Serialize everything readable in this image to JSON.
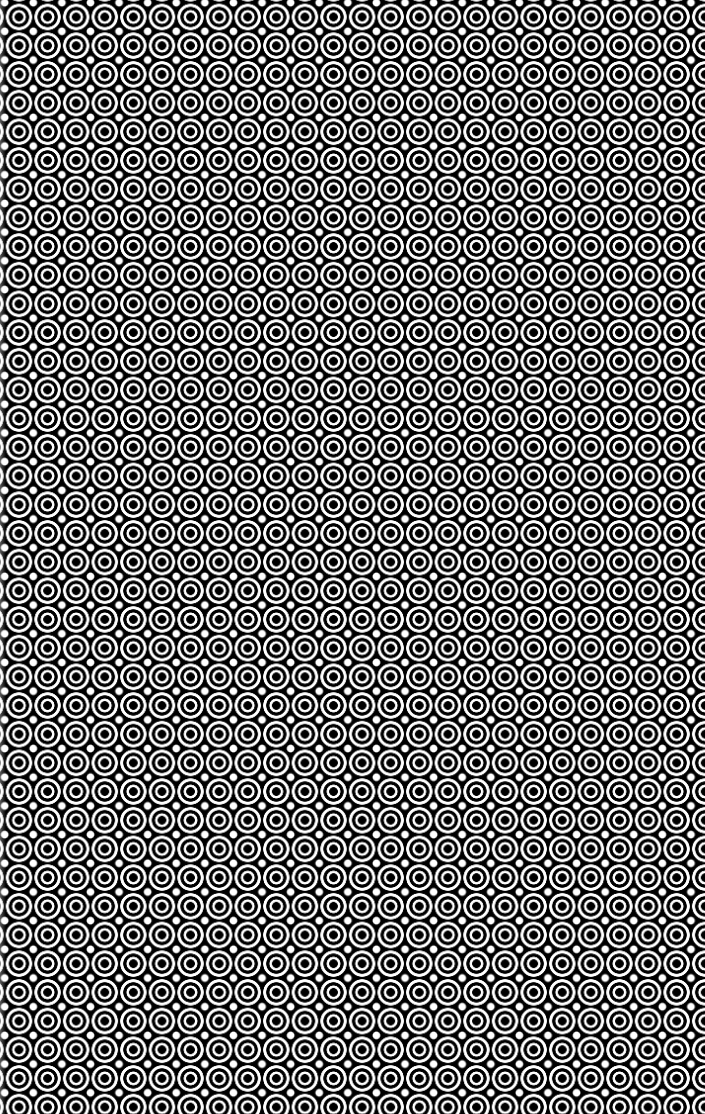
{
  "image": {
    "description": "Repeating pattern of black-and-white concentric circles (target/bullseye tiles) with white diamond shapes in the gaps",
    "colors": {
      "foreground": "#ffffff",
      "background": "#000000"
    },
    "tile": {
      "period_x_px": 28.6,
      "period_y_px": 28.7,
      "columns_visible": 24.7,
      "rows_visible": 38.8
    },
    "rings": [
      {
        "name": "center-dot",
        "color": "#000000"
      },
      {
        "name": "inner-white-ring",
        "color": "#ffffff"
      },
      {
        "name": "middle-black-ring",
        "color": "#000000"
      },
      {
        "name": "outer-white-ring",
        "color": "#ffffff"
      }
    ],
    "gap_shape": "diamond"
  }
}
